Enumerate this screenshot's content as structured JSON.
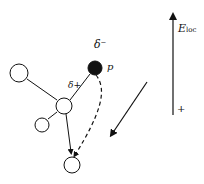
{
  "diagram": {
    "labels": {
      "delta_minus": "δ⁻",
      "delta_plus": "δ+",
      "proton": "p",
      "field_main": "E",
      "field_sub": "loc",
      "plus_sign": "+"
    },
    "colors": {
      "stroke": "#111111",
      "proton_fill": "#111111",
      "atom_fill": "#ffffff",
      "background": "#ffffff"
    },
    "atoms": [
      {
        "name": "atom-top-left",
        "cx": 19,
        "cy": 73,
        "r": 9
      },
      {
        "name": "atom-center",
        "cx": 64,
        "cy": 106,
        "r": 8
      },
      {
        "name": "atom-small-left",
        "cx": 42,
        "cy": 125,
        "r": 7
      },
      {
        "name": "atom-bottom",
        "cx": 72,
        "cy": 165,
        "r": 8
      },
      {
        "name": "proton",
        "cx": 95,
        "cy": 67,
        "r": 7,
        "filled": true
      }
    ]
  }
}
